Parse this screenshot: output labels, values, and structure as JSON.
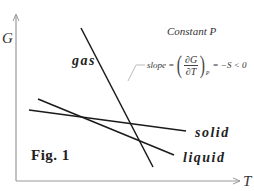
{
  "diagram": {
    "title": "Constant P",
    "figure_label": "Fig. 1",
    "axes": {
      "y_label": "G",
      "x_label": "T"
    },
    "lines": [
      {
        "name": "gas",
        "label": "gas",
        "x1": 81,
        "y1": 28,
        "x2": 153,
        "y2": 167
      },
      {
        "name": "solid",
        "label": "solid",
        "x1": 29,
        "y1": 110,
        "x2": 186,
        "y2": 131
      },
      {
        "name": "liquid",
        "label": "liquid",
        "x1": 38,
        "y1": 99,
        "x2": 174,
        "y2": 155
      }
    ],
    "annotation": {
      "slope_word": "slope =",
      "numerator": "∂G",
      "denominator": "∂T",
      "left_paren": "(",
      "right_paren": ")",
      "subscript": "P",
      "rhs": "= −S < 0"
    },
    "colors": {
      "line": "#1a1a1a",
      "axis": "#999999",
      "leader": "#aaaaaa",
      "text": "#222222"
    }
  }
}
